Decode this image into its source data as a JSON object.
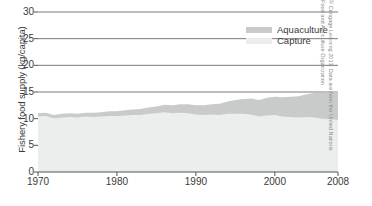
{
  "chart_data": {
    "type": "area",
    "title": "",
    "subtitle": "",
    "xlabel": "",
    "ylabel": "Fishery food supply (kg/capita)",
    "xlim": [
      1970,
      2008
    ],
    "ylim": [
      0,
      30
    ],
    "grid": true,
    "stacked": true,
    "legend_position": "top-right",
    "x_tick_labels": [
      "1970",
      "1980",
      "1990",
      "2000",
      "2008"
    ],
    "x_tick_values": [
      1970,
      1980,
      1990,
      2000,
      2008
    ],
    "y_tick_labels": [
      "0",
      "5",
      "10",
      "15",
      "20",
      "25",
      "30"
    ],
    "y_tick_values": [
      0,
      5,
      10,
      15,
      20,
      25,
      30
    ],
    "x": [
      1970,
      1971,
      1972,
      1973,
      1974,
      1975,
      1976,
      1977,
      1978,
      1979,
      1980,
      1981,
      1982,
      1983,
      1984,
      1985,
      1986,
      1987,
      1988,
      1989,
      1990,
      1991,
      1992,
      1993,
      1994,
      1995,
      1996,
      1997,
      1998,
      1999,
      2000,
      2001,
      2002,
      2003,
      2004,
      2005,
      2006,
      2007,
      2008
    ],
    "series": [
      {
        "name": "Capture",
        "color": "#eceded",
        "values": [
          10.4,
          10.5,
          10.1,
          10.2,
          10.3,
          10.2,
          10.4,
          10.3,
          10.4,
          10.5,
          10.5,
          10.6,
          10.7,
          10.7,
          10.9,
          11.0,
          11.2,
          11.0,
          11.1,
          11.0,
          10.8,
          10.7,
          10.8,
          10.7,
          10.9,
          10.9,
          10.9,
          10.8,
          10.4,
          10.6,
          10.7,
          10.4,
          10.3,
          10.2,
          10.3,
          10.2,
          10.0,
          9.9,
          9.8
        ]
      },
      {
        "name": "Aquaculture",
        "color": "#c9cbcb",
        "values": [
          0.6,
          0.6,
          0.6,
          0.7,
          0.7,
          0.7,
          0.7,
          0.8,
          0.8,
          0.9,
          0.9,
          1.0,
          1.0,
          1.1,
          1.2,
          1.3,
          1.4,
          1.5,
          1.6,
          1.7,
          1.7,
          1.8,
          1.9,
          2.1,
          2.3,
          2.6,
          2.8,
          3.0,
          3.1,
          3.3,
          3.4,
          3.6,
          3.8,
          4.0,
          4.3,
          4.6,
          4.8,
          5.1,
          5.4
        ]
      }
    ],
    "annotations": [
      "© Cengage Learning 2013. Data are from the United Nations",
      "Food and Agriculture Organization"
    ]
  },
  "legend": {
    "items": [
      {
        "label": "Aquaculture",
        "color": "#c9cbcb"
      },
      {
        "label": "Capture",
        "color": "#eceded"
      }
    ]
  },
  "credit": {
    "line1": "© Cengage Learning 2013. Data are from the United Nations",
    "line2": "Food and Agriculture Organization"
  },
  "colors": {
    "axis": "#555555",
    "grid": "#7a7a7a",
    "text": "#3a3a3a",
    "aquaculture": "#c9cbcb",
    "capture": "#eceded",
    "background": "#ffffff"
  }
}
